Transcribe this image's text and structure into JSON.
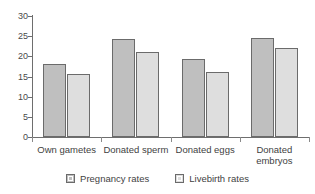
{
  "chart_data": {
    "type": "bar",
    "title": "",
    "xlabel": "",
    "ylabel": "",
    "ylim": [
      0,
      30
    ],
    "yticks": [
      0,
      5,
      10,
      15,
      20,
      25,
      30
    ],
    "ytick_labels": [
      "0",
      "5",
      "10",
      "15",
      "20",
      "25",
      "30"
    ],
    "grid": false,
    "legend_position": "bottom-center",
    "categories": [
      "Own gametes",
      "Donated sperm",
      "Donated eggs",
      "Donated\nembryos"
    ],
    "series": [
      {
        "name": "Pregnancy rates",
        "color": "#bfbfbf",
        "values": [
          18.2,
          24.3,
          19.3,
          24.5
        ]
      },
      {
        "name": "Livebirth rates",
        "color": "#dedede",
        "values": [
          15.7,
          21.0,
          16.0,
          22.0
        ]
      }
    ]
  },
  "legend": {
    "items": [
      {
        "label": "Pregnancy rates"
      },
      {
        "label": "Livebirth rates"
      }
    ]
  },
  "colors": {
    "axis": "#6e6e6e",
    "text": "#3f3f3f",
    "series_0": "#bfbfbf",
    "series_1": "#dedede",
    "bar_border": "#6b6b6b",
    "background": "#ffffff"
  }
}
